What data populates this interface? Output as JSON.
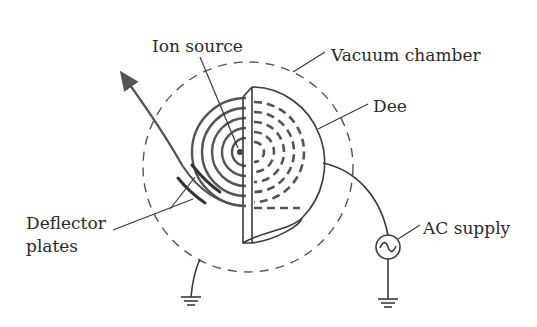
{
  "figure": {
    "labels": {
      "ion_source": "Ion source",
      "vacuum_chamber": "Vacuum chamber",
      "dee": "Dee",
      "deflector_line1": "Deflector",
      "deflector_line2": "plates",
      "ac_supply": "AC supply"
    },
    "symbols": {
      "ac_source": "~",
      "ground": "ground-symbol"
    },
    "colors": {
      "ink": "#2a2a2a",
      "orbit": "#555555",
      "background": "#ffffff"
    }
  }
}
